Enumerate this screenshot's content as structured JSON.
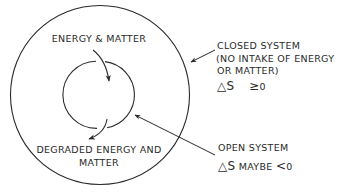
{
  "diagram": {
    "type": "nested-systems",
    "ink_color": "#2a2a2a",
    "background": "#ffffff",
    "inner_cycle": {
      "input_label": "ENERGY & MATTER",
      "output_label_line1": "DEGRADED ENERGY AND",
      "output_label_line2": "MATTER"
    },
    "closed_system": {
      "title": "CLOSED SYSTEM",
      "note_line1": "(NO INTAKE OF ENERGY",
      "note_line2": "OR MATTER)",
      "entropy_symbol": "△S",
      "entropy_relation": "≥",
      "entropy_value": "0"
    },
    "open_system": {
      "title": "OPEN SYSTEM",
      "entropy_symbol": "△S",
      "entropy_qualifier": "MAYBE",
      "entropy_relation": "<",
      "entropy_value": "0"
    }
  }
}
